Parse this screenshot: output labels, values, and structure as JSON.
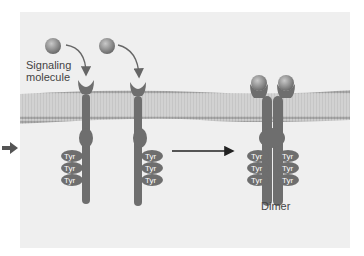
{
  "labels": {
    "signaling_molecule_line1": "Signaling",
    "signaling_molecule_line2": "molecule",
    "dimer": "Dimer",
    "tyr": "Tyr"
  },
  "colors": {
    "receptor": "#6e6e6e",
    "ligand": "#8a8a8a",
    "membrane": "#c8c8c8",
    "panel_bg": "#efefef",
    "arrow": "#222222"
  }
}
